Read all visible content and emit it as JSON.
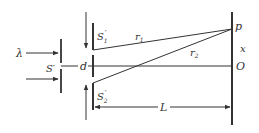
{
  "diagram": {
    "colors": {
      "ink": "#333333",
      "background": "#ffffff"
    },
    "labels": {
      "wavelength": "λ",
      "source_slit": "S′",
      "slit1_main": "S",
      "slit1_sub": "1",
      "slit1_prime": "′",
      "slit2_main": "S",
      "slit2_sub": "2",
      "slit2_prime": "′",
      "slit_separation": "d",
      "ray1_main": "r",
      "ray1_sub": "1",
      "ray2_main": "r",
      "ray2_sub": "2",
      "point_p": "p",
      "displacement": "x",
      "origin": "O",
      "distance": "L"
    },
    "components": [
      {
        "name": "incident light arrows",
        "count": 2
      },
      {
        "name": "single slit barrier S′"
      },
      {
        "name": "double slit barrier with slits S1′ and S2′"
      },
      {
        "name": "observation screen"
      },
      {
        "name": "ray r1 from S1′ to p"
      },
      {
        "name": "ray r2 from S2′ to p"
      },
      {
        "name": "central axis to O"
      },
      {
        "name": "distance L dimension line"
      }
    ]
  }
}
